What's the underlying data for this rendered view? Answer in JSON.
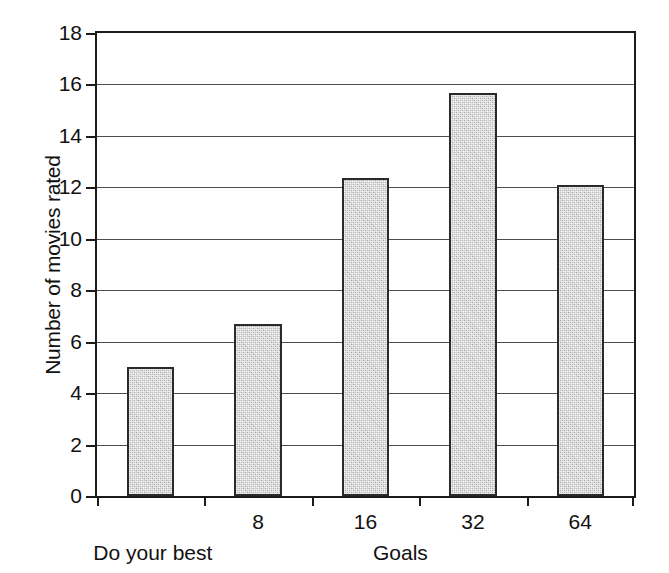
{
  "chart_data": {
    "type": "bar",
    "title": "",
    "subtitle": "",
    "xlabel": "Goals",
    "ylabel": "Number of movies rated",
    "categories": [
      "Do your best",
      "8",
      "16",
      "32",
      "64"
    ],
    "tick_labels": [
      "",
      "8",
      "16",
      "32",
      "64"
    ],
    "values": [
      5.0,
      6.7,
      12.35,
      15.65,
      12.1
    ],
    "ylim": [
      0,
      18
    ],
    "yticks": [
      0,
      2,
      4,
      6,
      8,
      10,
      12,
      14,
      16,
      18
    ],
    "ytick_labels": [
      "0",
      "2",
      "4",
      "6",
      "8",
      "10",
      "12",
      "14",
      "16",
      "18"
    ],
    "grid": true,
    "grid_axis": "y",
    "legend": false,
    "legend_position": "none",
    "first_category_caption": "Do your best",
    "bar_fill_color": "#c3c3c3",
    "bar_edge_color": "#2a2a2a",
    "axis_color": "#1b1b1b",
    "grid_color": "#4d4d4d",
    "background_color": "#ffffff"
  }
}
